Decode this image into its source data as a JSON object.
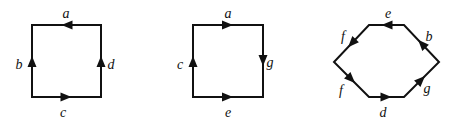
{
  "colors": {
    "stroke": "#111111",
    "background": "#ffffff"
  },
  "diagrams": [
    {
      "name": "square-1",
      "vertices": [
        [
          32,
          25
        ],
        [
          101,
          25
        ],
        [
          101,
          97
        ],
        [
          32,
          97
        ]
      ],
      "edges": [
        {
          "label": "a",
          "from": [
            101,
            25
          ],
          "to": [
            32,
            25
          ],
          "arrow": "left",
          "label_pos": [
            66,
            15
          ]
        },
        {
          "label": "b",
          "from": [
            32,
            97
          ],
          "to": [
            32,
            25
          ],
          "arrow": "up",
          "label_pos": [
            19,
            66
          ]
        },
        {
          "label": "d",
          "from": [
            101,
            97
          ],
          "to": [
            101,
            25
          ],
          "arrow": "up",
          "label_pos": [
            111,
            66
          ]
        },
        {
          "label": "c",
          "from": [
            32,
            97
          ],
          "to": [
            101,
            97
          ],
          "arrow": "right",
          "label_pos": [
            63,
            114
          ]
        }
      ]
    },
    {
      "name": "square-2",
      "vertices": [
        [
          193,
          25
        ],
        [
          263,
          25
        ],
        [
          263,
          97
        ],
        [
          193,
          97
        ]
      ],
      "edges": [
        {
          "label": "a",
          "from": [
            193,
            25
          ],
          "to": [
            263,
            25
          ],
          "arrow": "right",
          "label_pos": [
            228,
            15
          ]
        },
        {
          "label": "c",
          "from": [
            193,
            97
          ],
          "to": [
            193,
            25
          ],
          "arrow": "up",
          "label_pos": [
            180,
            66
          ]
        },
        {
          "label": "g",
          "from": [
            263,
            25
          ],
          "to": [
            263,
            97
          ],
          "arrow": "down",
          "label_pos": [
            270,
            64
          ]
        },
        {
          "label": "e",
          "from": [
            193,
            97
          ],
          "to": [
            263,
            97
          ],
          "arrow": "right",
          "label_pos": [
            228,
            114
          ]
        }
      ]
    },
    {
      "name": "hexagon",
      "vertices": [
        [
          369,
          25
        ],
        [
          404,
          25
        ],
        [
          439,
          62
        ],
        [
          404,
          97
        ],
        [
          369,
          97
        ],
        [
          334,
          62
        ]
      ],
      "edges": [
        {
          "label": "e",
          "from": [
            404,
            25
          ],
          "to": [
            369,
            25
          ],
          "arrow": "left",
          "label_pos": [
            388,
            15
          ]
        },
        {
          "label": "f",
          "from": [
            369,
            25
          ],
          "to": [
            334,
            62
          ],
          "arrow": "down-left",
          "label_pos": [
            343,
            38
          ]
        },
        {
          "label": "f",
          "from": [
            334,
            62
          ],
          "to": [
            369,
            97
          ],
          "arrow": "down-right",
          "label_pos": [
            341,
            92
          ]
        },
        {
          "label": "d",
          "from": [
            369,
            97
          ],
          "to": [
            404,
            97
          ],
          "arrow": "right",
          "label_pos": [
            383,
            114
          ]
        },
        {
          "label": "g",
          "from": [
            404,
            97
          ],
          "to": [
            439,
            62
          ],
          "arrow": "up-right",
          "label_pos": [
            427,
            90
          ]
        },
        {
          "label": "b",
          "from": [
            439,
            62
          ],
          "to": [
            404,
            25
          ],
          "arrow": "up-left",
          "label_pos": [
            429,
            38
          ]
        }
      ]
    }
  ]
}
